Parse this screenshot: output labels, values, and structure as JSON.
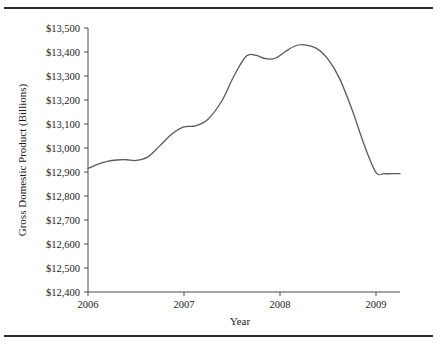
{
  "figure": {
    "background_color": "#ffffff",
    "rule_color": "#2b2b2b",
    "line_color": "#5a5a5f",
    "axis_color": "#4a4a4a"
  },
  "chart_data": {
    "type": "line",
    "title": "",
    "xlabel": "Year",
    "ylabel": "Gross Domestic Product (Billions)",
    "xlim": [
      2006,
      2009.25
    ],
    "ylim": [
      12400,
      13500
    ],
    "grid": false,
    "legend": false,
    "x_tick_labels": [
      "2006",
      "2007",
      "2008",
      "2009"
    ],
    "x_ticks": [
      2006,
      2007,
      2008,
      2009
    ],
    "y_tick_labels": [
      "$13,500",
      "$13,400",
      "$13,300",
      "$13,200",
      "$13,100",
      "$13,000",
      "$12,900",
      "$12,800",
      "$12,700",
      "$12,600",
      "$12,500",
      "$12,400"
    ],
    "y_ticks": [
      13500,
      13400,
      13300,
      13200,
      13100,
      13000,
      12900,
      12800,
      12700,
      12600,
      12500,
      12400
    ],
    "series": [
      {
        "name": "Gross Domestic Product",
        "x": [
          2006.0,
          2006.1,
          2006.2,
          2006.3,
          2006.4,
          2006.5,
          2006.62,
          2006.75,
          2006.88,
          2007.0,
          2007.12,
          2007.25,
          2007.4,
          2007.52,
          2007.65,
          2007.75,
          2007.85,
          2007.95,
          2008.05,
          2008.15,
          2008.25,
          2008.38,
          2008.5,
          2008.62,
          2008.75,
          2008.88,
          2009.0,
          2009.08,
          2009.16,
          2009.25
        ],
        "y": [
          12915,
          12932,
          12944,
          12950,
          12951,
          12948,
          12962,
          13010,
          13060,
          13088,
          13092,
          13120,
          13200,
          13300,
          13383,
          13386,
          13372,
          13374,
          13400,
          13424,
          13430,
          13415,
          13370,
          13290,
          13160,
          13010,
          12898,
          12893,
          12893,
          12893
        ]
      }
    ]
  }
}
